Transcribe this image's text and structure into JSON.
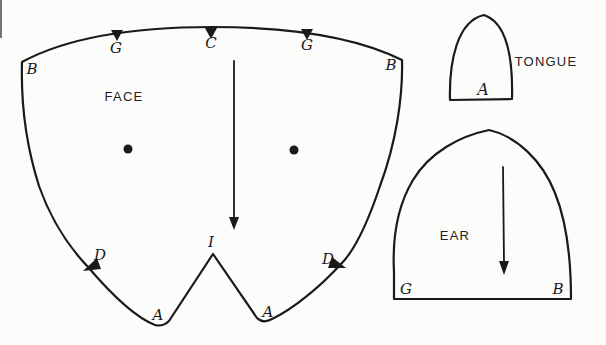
{
  "colors": {
    "ink": "#1a1a1a",
    "paper": "#fcfcfb"
  },
  "icons": {
    "grain_arrow_face": "down-arrow",
    "grain_arrow_ear": "down-arrow",
    "notch_mark": "filled-triangle",
    "eye_dot": "filled-circle"
  },
  "pieces": {
    "face": {
      "name": "FACE",
      "labels": {
        "b_left": "B",
        "g_left": "G",
        "c_top": "C",
        "g_right": "G",
        "b_right": "B",
        "d_left": "D",
        "i_center": "I",
        "d_right": "D",
        "a_left": "A",
        "a_right": "A"
      }
    },
    "tongue": {
      "name": "TONGUE",
      "labels": {
        "a_bottom": "A"
      }
    },
    "ear": {
      "name": "EAR",
      "labels": {
        "g_left": "G",
        "b_right": "B"
      }
    }
  }
}
